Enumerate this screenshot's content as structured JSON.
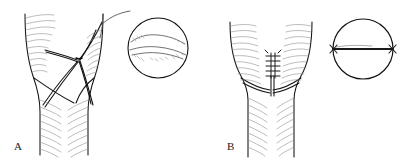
{
  "figure": {
    "background_color": "#ffffff",
    "outline_color": "#131313",
    "hatch_color": "#8a8a8a",
    "suture_color": "#1a1a1a",
    "width": 405,
    "height": 161
  },
  "panels": [
    {
      "id": "A",
      "label": "A",
      "caption": "Lacerated vessel with splayed open defect and trailing suture thread",
      "label_x": 14,
      "label_y": 150,
      "main_drawing": {
        "name": "lacerated-vessel",
        "state": "open-defect",
        "defect_apex_x": 78,
        "defect_apex_y": 60,
        "suture_tail": "present"
      },
      "inset": {
        "name": "cross-section-open",
        "cx": 158,
        "cy": 48,
        "r": 30,
        "interior_line": "irregular-wavy",
        "description": "Cross-sectional view showing irregular torn edge"
      }
    },
    {
      "id": "B",
      "label": "B",
      "caption": "Repaired vessel with interrupted sutures approximating the edges",
      "label_x": 227,
      "label_y": 150,
      "main_drawing": {
        "name": "repaired-vessel",
        "state": "sutured",
        "suture_ladder_x": 285,
        "suture_ladder_top_y": 55,
        "suture_ladder_bottom_y": 85,
        "suture_count": 5
      },
      "inset": {
        "name": "cross-section-repaired",
        "cx": 363,
        "cy": 49,
        "r": 30,
        "interior_line": "straight-horizontal-suture",
        "knot_ends": 2,
        "description": "Cross-sectional view showing straight approximated suture line with terminal knots"
      }
    }
  ]
}
